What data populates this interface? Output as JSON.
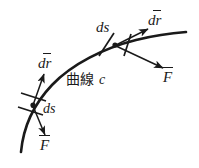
{
  "figure": {
    "kind": "vector-calculus-diagram",
    "title": "",
    "background_color": "#ffffff",
    "stroke_color": "#1a1a1a",
    "curve": {
      "name": "curve-c",
      "label_cjk": "曲線",
      "label_symbol": "c",
      "description": "smooth arc rising from lower-left to upper-right"
    },
    "points": [
      {
        "id": "lower-point",
        "ds_label": "ds",
        "dr_label": "dr",
        "force_label": "F",
        "dr_has_vector_bar": true,
        "force_has_vector_bar": true
      },
      {
        "id": "upper-point",
        "ds_label": "ds",
        "dr_label": "dr",
        "force_label": "F",
        "dr_has_vector_bar": true,
        "force_has_vector_bar": true
      }
    ],
    "labels": {
      "ds_upper": "ds",
      "ds_lower": "ds",
      "dr_upper": "dr",
      "dr_lower": "dr",
      "force_upper": "F",
      "force_lower": "F",
      "curve_cjk": "曲線",
      "curve_symbol": "c"
    }
  }
}
